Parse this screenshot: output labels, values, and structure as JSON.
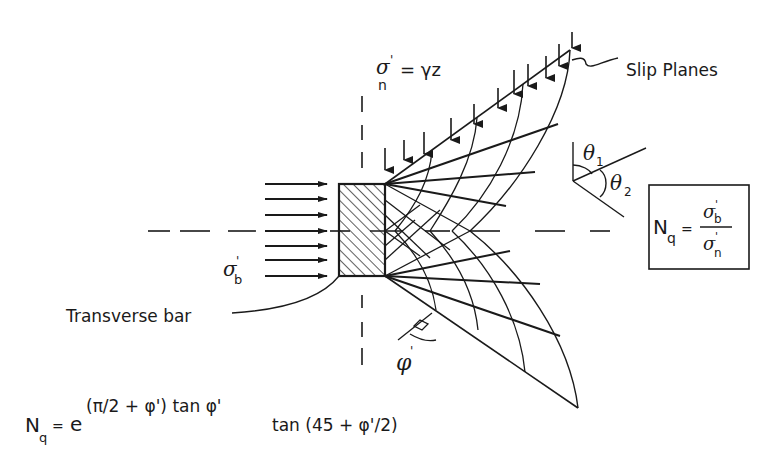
{
  "diagram": {
    "type": "geotechnical-bearing-mechanism",
    "labels": {
      "slip_planes": "Slip Planes",
      "transverse_bar": "Transverse bar",
      "sigma_n_lhs": "σ",
      "sigma_n_sub": "n",
      "sigma_n_prime": "'",
      "sigma_n_rhs": "= γz",
      "sigma_b": "σ",
      "sigma_b_sub": "b",
      "sigma_b_prime": "'",
      "theta1": "θ",
      "theta1_sub": "1",
      "theta2": "θ",
      "theta2_sub": "2",
      "phi": "φ",
      "phi_prime": "'"
    },
    "boxed_formula": {
      "lhs": "N",
      "lhs_sub": "q",
      "equals": "=",
      "numerator": "σ",
      "numerator_sub": "b",
      "numerator_prime": "'",
      "denominator": "σ",
      "denominator_sub": "n",
      "denominator_prime": "'"
    },
    "bottom_formula": {
      "lhs": "N",
      "lhs_sub": "q",
      "equals": "=",
      "base": "e",
      "exponent": "(π/2 + φ') tan φ'",
      "factor": "tan (45 + φ'/2)"
    },
    "load_arrows": {
      "horizontal_count": 7,
      "vertical_count": 11
    }
  }
}
